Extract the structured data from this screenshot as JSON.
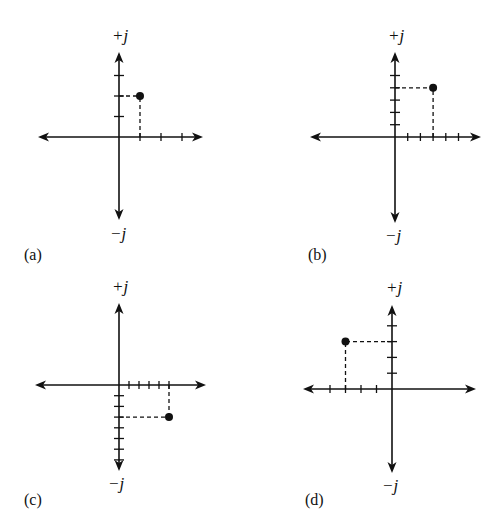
{
  "figure": {
    "panels": [
      {
        "id": "a",
        "label": "(a)",
        "pos_axis_label": "+j",
        "neg_axis_label": "−j",
        "origin": [
          119,
          137
        ],
        "x_arrow": [
          38,
          203
        ],
        "y_arrow": [
          52,
          220
        ],
        "x_unit": 21,
        "y_unit": 20.5,
        "x_ticks": [
          1,
          2,
          3
        ],
        "y_ticks": [
          1,
          2,
          3
        ],
        "point": [
          1,
          2
        ],
        "label_pos": [
          24,
          262
        ],
        "plus_pos": [
          112,
          42
        ],
        "minus_pos": [
          110,
          240
        ]
      },
      {
        "id": "b",
        "label": "(b)",
        "pos_axis_label": "+j",
        "neg_axis_label": "−j",
        "origin": [
          395,
          137
        ],
        "x_arrow": [
          310,
          481
        ],
        "y_arrow": [
          52,
          223
        ],
        "x_unit": 12.7,
        "y_unit": 12.3,
        "x_ticks": [
          1,
          2,
          3,
          4,
          5
        ],
        "y_ticks": [
          1,
          2,
          3,
          4,
          5
        ],
        "point": [
          3,
          4
        ],
        "label_pos": [
          308,
          262
        ],
        "plus_pos": [
          388,
          42
        ],
        "minus_pos": [
          385,
          242
        ]
      },
      {
        "id": "c",
        "label": "(c)",
        "pos_axis_label": "+j",
        "neg_axis_label": "−j",
        "origin": [
          119,
          385
        ],
        "x_arrow": [
          35,
          206
        ],
        "y_arrow": [
          303,
          471
        ],
        "x_unit": 10,
        "y_unit": 10.7,
        "x_ticks": [
          1,
          2,
          3,
          4,
          5
        ],
        "y_ticks": [
          -1,
          -2,
          -3,
          -4,
          -5,
          -6,
          -7
        ],
        "point": [
          5,
          -3
        ],
        "label_pos": [
          24,
          507
        ],
        "plus_pos": [
          112,
          293
        ],
        "minus_pos": [
          108,
          490
        ]
      },
      {
        "id": "d",
        "label": "(d)",
        "pos_axis_label": "+j",
        "neg_axis_label": "−j",
        "origin": [
          392,
          389
        ],
        "x_arrow": [
          303,
          476
        ],
        "y_arrow": [
          305,
          473
        ],
        "x_unit": 15.5,
        "y_unit": 15.8,
        "x_ticks": [
          -1,
          -2,
          -3,
          -4
        ],
        "y_ticks": [
          1,
          2,
          3,
          4
        ],
        "point": [
          -3,
          3
        ],
        "label_pos": [
          305,
          507
        ],
        "plus_pos": [
          386,
          294
        ],
        "minus_pos": [
          382,
          492
        ]
      }
    ]
  },
  "chart_data": [
    {
      "type": "scatter",
      "title": "(a)",
      "xlabel": "real",
      "ylabel": "+j / −j",
      "x": [
        1
      ],
      "y": [
        2
      ],
      "grid": false,
      "note": "complex number 1 + j2 plotted on complex plane"
    },
    {
      "type": "scatter",
      "title": "(b)",
      "xlabel": "real",
      "ylabel": "+j / −j",
      "x": [
        3
      ],
      "y": [
        4
      ],
      "grid": false,
      "note": "complex number 3 + j4"
    },
    {
      "type": "scatter",
      "title": "(c)",
      "xlabel": "real",
      "ylabel": "+j / −j",
      "x": [
        5
      ],
      "y": [
        -3
      ],
      "grid": false,
      "note": "complex number 5 − j3"
    },
    {
      "type": "scatter",
      "title": "(d)",
      "xlabel": "real",
      "ylabel": "+j / −j",
      "x": [
        -3
      ],
      "y": [
        3
      ],
      "grid": false,
      "note": "complex number −3 + j3"
    }
  ]
}
